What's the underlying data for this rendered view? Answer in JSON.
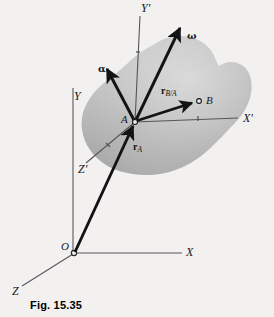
{
  "figure": {
    "caption": "Fig. 15.35",
    "background_color": "#f3f1ef",
    "body_fill_color": "#b9b9b9",
    "line_color": "#1a1a1a",
    "thin_line_color": "#55555a"
  },
  "axes": {
    "fixed_frame": [
      {
        "name": "x-axis",
        "label": "X",
        "label_x": 186,
        "label_y": 248
      },
      {
        "name": "y-axis",
        "label": "Y",
        "label_x": 74,
        "label_y": 92
      },
      {
        "name": "z-axis",
        "label": "Z",
        "label_x": 12,
        "label_y": 287
      }
    ],
    "moving_frame": [
      {
        "name": "x-prime-axis",
        "label": "X",
        "prime": "′",
        "label_x": 243,
        "label_y": 114
      },
      {
        "name": "y-prime-axis",
        "label": "Y",
        "prime": "′",
        "label_x": 142,
        "label_y": 4
      },
      {
        "name": "z-prime-axis",
        "label": "Z",
        "prime": "′",
        "label_x": 78,
        "label_y": 165
      }
    ]
  },
  "points": [
    {
      "name": "point-o",
      "label": "O",
      "label_x": 61,
      "label_y": 241
    },
    {
      "name": "point-a",
      "label": "A",
      "label_x": 121,
      "label_y": 114
    },
    {
      "name": "point-b",
      "label": "B",
      "label_x": 206,
      "label_y": 97
    }
  ],
  "vectors": [
    {
      "name": "omega-vector",
      "label": "ω",
      "label_x": 187,
      "label_y": 33,
      "kind": "greek"
    },
    {
      "name": "alpha-vector",
      "label": "α",
      "label_x": 98,
      "label_y": 66,
      "kind": "greek"
    },
    {
      "name": "r-b-over-a-vector",
      "label": "r",
      "subscript": "B/A",
      "label_x": 161,
      "label_y": 88,
      "kind": "bold"
    },
    {
      "name": "r-a-vector",
      "label": "r",
      "subscript": "A",
      "label_x": 133,
      "label_y": 144,
      "kind": "bold"
    }
  ]
}
